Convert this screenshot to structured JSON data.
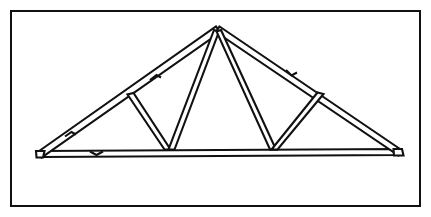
{
  "figure": {
    "style": "black-and-white line drawing, double-line (outlined) members",
    "background_color": "#ffffff",
    "line_color": "#111111"
  },
  "frame": {
    "name": "drawing-border",
    "stroke_color": "#111111",
    "stroke_width_px": 2,
    "x": 10,
    "y": 10,
    "width": 411,
    "height": 197
  },
  "geometry": {
    "units": "pixels",
    "member_thickness_px": 5,
    "nodes": {
      "apex": [
        218,
        30
      ],
      "left_heel": [
        38,
        155
      ],
      "right_heel": [
        400,
        153
      ],
      "bottom_left": [
        44,
        153
      ],
      "bottom_right": [
        395,
        151
      ],
      "left_panel_top": [
        131,
        96
      ],
      "right_panel_top": [
        320,
        96
      ],
      "left_panel_bottom": [
        167,
        148
      ],
      "right_panel_bottom": [
        273,
        148
      ]
    },
    "members": [
      {
        "name": "top-chord-left",
        "from": "left_heel",
        "to": "apex"
      },
      {
        "name": "top-chord-right",
        "from": "apex",
        "to": "right_heel"
      },
      {
        "name": "bottom-chord",
        "from": "bottom_left",
        "to": "bottom_right"
      },
      {
        "name": "web-left-outer",
        "from": "left_panel_top",
        "to": "left_panel_bottom"
      },
      {
        "name": "web-left-king",
        "from": "apex",
        "to": "left_panel_bottom"
      },
      {
        "name": "web-right-king",
        "from": "apex",
        "to": "right_panel_bottom"
      },
      {
        "name": "web-right-outer",
        "from": "right_panel_top",
        "to": "right_panel_bottom"
      }
    ],
    "splices": [
      {
        "name": "splice-top-chord-left-lower",
        "at": [
          70,
          133
        ]
      },
      {
        "name": "splice-top-chord-left-upper",
        "at": [
          155,
          76
        ]
      },
      {
        "name": "splice-top-chord-right-upper",
        "at": [
          292,
          73
        ]
      },
      {
        "name": "splice-bottom-chord-left",
        "at": [
          97,
          152
        ]
      }
    ]
  },
  "labels": {
    "figure_caption": "",
    "dimensions": [],
    "annotations": []
  }
}
